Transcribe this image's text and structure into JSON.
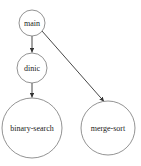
{
  "diagram": {
    "type": "directed-graph",
    "nodes": [
      {
        "id": "main",
        "label": "main",
        "cx": 32,
        "cy": 23,
        "r": 13
      },
      {
        "id": "dinic",
        "label": "dinic",
        "cx": 32,
        "cy": 68,
        "r": 15
      },
      {
        "id": "binary-search",
        "label": "binary-search",
        "cx": 32,
        "cy": 128,
        "r": 30
      },
      {
        "id": "merge-sort",
        "label": "merge-sort",
        "cx": 108,
        "cy": 128,
        "r": 27
      }
    ],
    "edges": [
      {
        "from": "main",
        "to": "dinic"
      },
      {
        "from": "dinic",
        "to": "binary-search"
      },
      {
        "from": "main",
        "to": "merge-sort"
      }
    ],
    "colors": {
      "node_stroke": "#777777",
      "edge": "#333333",
      "text": "#222222",
      "background": "#ffffff"
    }
  }
}
